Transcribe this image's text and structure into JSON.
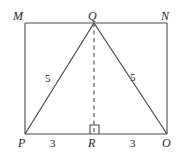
{
  "figure": {
    "kind": "geometry-diagram",
    "stroke_color": "#4a4a4a",
    "label_color": "#262626",
    "background_color": "#ffffff",
    "vertices": [
      {
        "id": "M",
        "label": "M",
        "x": 25,
        "y": 23,
        "role": "rectangle-corner-top-left"
      },
      {
        "id": "Q",
        "label": "Q",
        "x": 94,
        "y": 23,
        "role": "triangle-apex-on-top-edge"
      },
      {
        "id": "N",
        "label": "N",
        "x": 167,
        "y": 23,
        "role": "rectangle-corner-top-right"
      },
      {
        "id": "P",
        "label": "P",
        "x": 25,
        "y": 134,
        "role": "rectangle-corner-bottom-left"
      },
      {
        "id": "R",
        "label": "R",
        "x": 94,
        "y": 134,
        "role": "foot-of-altitude"
      },
      {
        "id": "O",
        "label": "O",
        "x": 167,
        "y": 134,
        "role": "rectangle-corner-bottom-right"
      }
    ],
    "segments": [
      {
        "id": "MN",
        "from": "M",
        "to": "N",
        "style": "solid",
        "kind": "rectangle-top-edge"
      },
      {
        "id": "NO",
        "from": "N",
        "to": "O",
        "style": "solid",
        "kind": "rectangle-right-edge"
      },
      {
        "id": "OP",
        "from": "O",
        "to": "P",
        "style": "solid",
        "kind": "rectangle-bottom-edge"
      },
      {
        "id": "PM",
        "from": "P",
        "to": "M",
        "style": "solid",
        "kind": "rectangle-left-edge"
      },
      {
        "id": "PQ",
        "from": "P",
        "to": "Q",
        "style": "solid",
        "kind": "triangle-leg-left"
      },
      {
        "id": "QO",
        "from": "Q",
        "to": "O",
        "style": "solid",
        "kind": "triangle-leg-right"
      },
      {
        "id": "QR",
        "from": "Q",
        "to": "R",
        "style": "dashed",
        "kind": "altitude"
      }
    ],
    "measurements": [
      {
        "id": "side-left",
        "value": "5",
        "segment": "PQ",
        "x": 45,
        "y": 73
      },
      {
        "id": "side-right",
        "value": "5",
        "segment": "QO",
        "x": 130,
        "y": 72
      },
      {
        "id": "base-left",
        "value": "3",
        "segment": "PR",
        "x": 50,
        "y": 138
      },
      {
        "id": "base-right",
        "value": "3",
        "segment": "RO",
        "x": 130,
        "y": 138
      }
    ],
    "markers": [
      {
        "id": "right-angle-at-R",
        "type": "right-angle-square",
        "at_vertex": "R",
        "x": 90,
        "y": 125,
        "size": 9
      }
    ]
  }
}
